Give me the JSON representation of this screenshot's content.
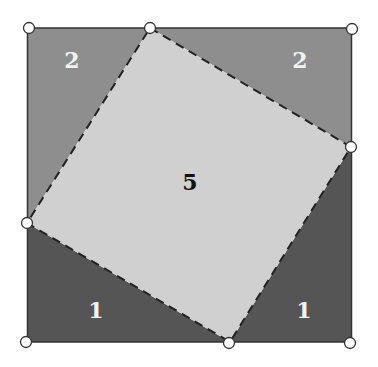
{
  "diagram": {
    "regions": [
      {
        "id": "top-left-triangle",
        "label": "2",
        "color": "#8e8e8e"
      },
      {
        "id": "top-right-triangle",
        "label": "2",
        "color": "#8e8e8e"
      },
      {
        "id": "bottom-left-triangle",
        "label": "1",
        "color": "#555555"
      },
      {
        "id": "bottom-right-triangle",
        "label": "1",
        "color": "#555555"
      },
      {
        "id": "inner-square",
        "label": "5",
        "color": "#d0d0d0"
      }
    ],
    "colors": {
      "border": "#333333",
      "label_light": "#f2f2f2",
      "label_dark": "#111111",
      "vertex_fill": "#ffffff"
    }
  }
}
